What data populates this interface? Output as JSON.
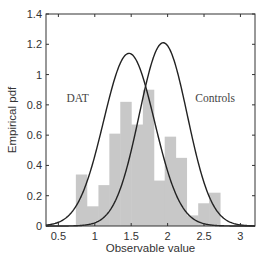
{
  "chart_data": {
    "type": "bar",
    "title": "",
    "xlabel": "Observable value",
    "ylabel": "Empirical pdf",
    "xlim": [
      0.33,
      3.2
    ],
    "ylim": [
      0,
      1.4
    ],
    "xticks": [
      0.5,
      1,
      1.5,
      2,
      2.5,
      3
    ],
    "xtick_labels": [
      "0.5",
      "1",
      "1.5",
      "2",
      "2.5",
      "3"
    ],
    "yticks": [
      0,
      0.2,
      0.4,
      0.6,
      0.8,
      1,
      1.2,
      1.4
    ],
    "ytick_labels": [
      "0",
      "0.2",
      "0.4",
      "0.6",
      "0.8",
      "1",
      "1.2",
      "1.4"
    ],
    "grid": false,
    "histogram": {
      "bin_edges": [
        0.74,
        0.89,
        1.05,
        1.2,
        1.35,
        1.5,
        1.66,
        1.81,
        1.96,
        2.11,
        2.26,
        2.42,
        2.57,
        2.72
      ],
      "values": [
        0.34,
        0.13,
        0.27,
        0.61,
        0.82,
        0.67,
        0.9,
        0.3,
        0.59,
        0.45,
        0.07,
        0.15,
        0.22
      ],
      "color": "#c8c8c8"
    },
    "series": [
      {
        "name": "DAT",
        "type": "gaussian",
        "mean": 1.47,
        "peak": 1.14,
        "sigma": 0.35,
        "color": "#222222"
      },
      {
        "name": "Controls",
        "type": "gaussian",
        "mean": 1.94,
        "peak": 1.21,
        "sigma": 0.33,
        "color": "#222222"
      }
    ],
    "annotations": [
      {
        "text": "DAT",
        "x": 0.61,
        "y": 0.82
      },
      {
        "text": "Controls",
        "x": 2.38,
        "y": 0.82
      }
    ]
  }
}
